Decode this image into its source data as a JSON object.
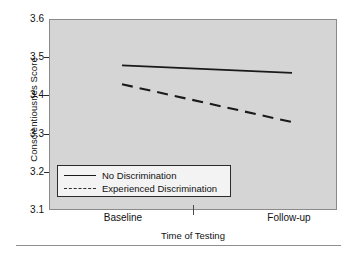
{
  "chart_data": {
    "type": "line",
    "title": "",
    "xlabel": "Time of Testing",
    "ylabel": "Conscientiousnes Score",
    "categories": [
      "Baseline",
      "Follow-up"
    ],
    "x_tick_labels": [
      "Baseline",
      "Follow-up"
    ],
    "y_tick_labels": [
      "3.6",
      "3.5",
      "3.4",
      "3.3",
      "3.2",
      "3.1"
    ],
    "y_ticks": [
      3.6,
      3.5,
      3.4,
      3.3,
      3.2,
      3.1
    ],
    "ylim": [
      3.1,
      3.6
    ],
    "xlim": [
      0,
      1
    ],
    "grid": false,
    "legend_position": "lower-left-inside",
    "plot_background": "#d5d5d5",
    "line_color": "#1a1a1a",
    "series": [
      {
        "name": "No Discrimination",
        "style": "solid",
        "values": [
          3.48,
          3.46
        ]
      },
      {
        "name": "Experienced Discrimination",
        "style": "dashed",
        "values": [
          3.43,
          3.33
        ]
      }
    ]
  },
  "axes": {
    "y_title": "Conscientiousnes Score",
    "x_title": "Time of Testing",
    "y_labels": [
      "3.6",
      "3.5",
      "3.4",
      "3.3",
      "3.2",
      "3.1"
    ],
    "x_labels": [
      "Baseline",
      "Follow-up"
    ]
  },
  "legend": {
    "entries": [
      {
        "label": "No Discrimination",
        "style": "solid"
      },
      {
        "label": "Experienced Discrimination",
        "style": "dashed"
      }
    ]
  }
}
